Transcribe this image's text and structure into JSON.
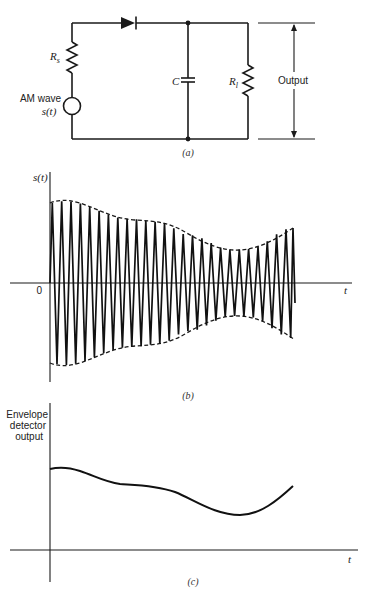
{
  "figure": {
    "panel_a": {
      "caption": "(a)",
      "components": {
        "source_label_line1": "AM wave",
        "source_label_line2": "s(t)",
        "source_resistor": "R",
        "source_resistor_sub": "s",
        "capacitor": "C",
        "load_resistor": "R",
        "load_resistor_sub": "l",
        "output_label": "Output",
        "diode": "diode"
      }
    },
    "panel_b": {
      "caption": "(b)",
      "y_label": "s(t)",
      "x_label": "t",
      "origin_label": "0"
    },
    "panel_c": {
      "caption": "(c)",
      "y_label_line1": "Envelope",
      "y_label_line2": "detector",
      "y_label_line3": "output",
      "x_label": "t"
    }
  },
  "chart_data": [
    {
      "type": "line",
      "title": "(b) AM wave s(t) with envelope",
      "xlabel": "t",
      "ylabel": "s(t)",
      "description": "Carrier oscillation (~26 cycles) bounded by dashed upper and lower envelopes, symmetric about the t axis",
      "envelope_x": [
        0,
        0.06,
        0.33,
        0.45,
        0.57,
        0.75,
        0.82,
        1.0
      ],
      "envelope_upper": [
        0.8,
        0.82,
        0.64,
        0.61,
        0.48,
        0.33,
        0.34,
        0.55
      ],
      "carrier_cycles": 26,
      "grid": false
    },
    {
      "type": "line",
      "title": "(c) Envelope detector output",
      "xlabel": "t",
      "ylabel": "Envelope detector output",
      "x": [
        0,
        0.06,
        0.29,
        0.41,
        0.53,
        0.78,
        1.0
      ],
      "values": [
        0.55,
        0.56,
        0.45,
        0.44,
        0.39,
        0.24,
        0.43
      ],
      "grid": false
    }
  ]
}
